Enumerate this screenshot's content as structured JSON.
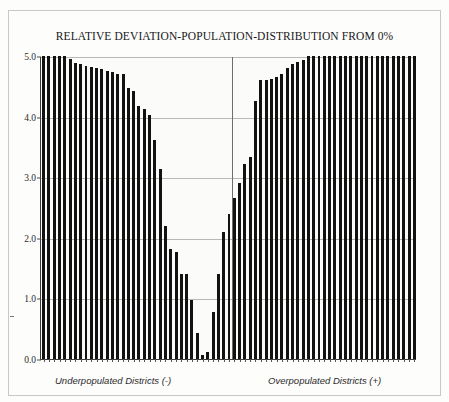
{
  "chart_data": {
    "type": "bar",
    "title": "RELATIVE DEVIATION-POPULATION-DISTRIBUTION FROM 0%",
    "xlabel": "",
    "ylabel": "",
    "ylim": [
      0.0,
      5.0
    ],
    "yticks": [
      "0.0",
      "1.0",
      "2.0",
      "3.0",
      "4.0",
      "5.0"
    ],
    "ytick_values": [
      0.0,
      1.0,
      2.0,
      3.0,
      4.0,
      5.0
    ],
    "grid": true,
    "legend": null,
    "annotations": [
      "Underpopulated Districts (-)",
      "Overpopulated Districts (+)"
    ],
    "center_divider_at_index": 36,
    "bar_color": "#121212",
    "series": [
      {
        "name": "Underpopulated Districts (-)",
        "values": [
          5.0,
          5.0,
          5.0,
          5.0,
          5.0,
          4.95,
          4.88,
          4.86,
          4.84,
          4.82,
          4.8,
          4.78,
          4.76,
          4.73,
          4.71,
          4.7,
          4.48,
          4.42,
          4.17,
          4.13,
          4.02,
          3.62,
          3.13,
          2.2,
          1.82,
          1.77,
          1.4,
          1.4,
          0.97,
          0.43,
          0.07
        ]
      },
      {
        "name": "Overpopulated Districts (+)",
        "values": [
          0.12,
          0.78,
          1.4,
          2.1,
          2.4,
          2.65,
          2.9,
          3.22,
          3.33,
          4.25,
          4.6,
          4.6,
          4.62,
          4.66,
          4.7,
          4.8,
          4.86,
          4.9,
          4.93,
          5.0,
          5.0,
          5.0,
          5.0,
          5.0,
          5.0,
          5.0,
          5.0,
          5.0,
          5.0,
          5.0,
          5.0,
          5.0,
          5.0,
          5.0,
          5.0,
          5.0,
          5.0,
          5.0,
          5.0,
          5.0
        ]
      }
    ]
  },
  "captions": {
    "left": "Underpopulated Districts (-)",
    "right": "Overpopulated Districts (+)"
  }
}
